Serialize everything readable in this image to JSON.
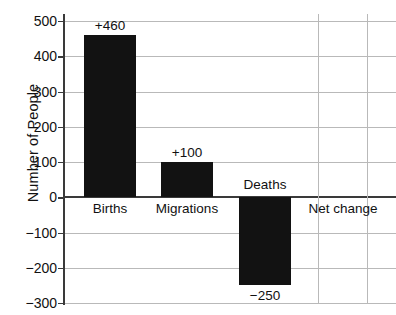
{
  "chart_data": {
    "type": "bar",
    "title": "",
    "xlabel": "",
    "ylabel": "Number of People",
    "categories": [
      "Births",
      "Migrations",
      "Deaths",
      "Net change"
    ],
    "values": [
      460,
      100,
      -250,
      null
    ],
    "data_labels": [
      "+460",
      "+100",
      "−250",
      ""
    ],
    "ylim": [
      -300,
      500
    ],
    "yticks": [
      500,
      400,
      300,
      200,
      100,
      0,
      -100,
      -200,
      -300
    ],
    "ytick_labels": [
      "500",
      "400",
      "300",
      "200",
      "100",
      "0",
      "−100",
      "−200",
      "−300"
    ],
    "grid": "horizontal-and-partial-vertical",
    "legend": "none",
    "bar_color": "#121212",
    "gridline_color": "#b9b9b9",
    "axis_color": "#3a3a3a"
  },
  "axis": {
    "y_title": "Number of People"
  }
}
